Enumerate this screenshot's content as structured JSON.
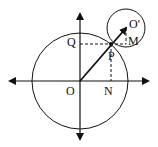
{
  "diagram": {
    "labels": {
      "origin": "O",
      "center2": "O'",
      "p": "P",
      "q": "Q",
      "m": "M",
      "n": "N"
    },
    "colors": {
      "stroke": "#111111",
      "background": "#ffffff"
    }
  }
}
